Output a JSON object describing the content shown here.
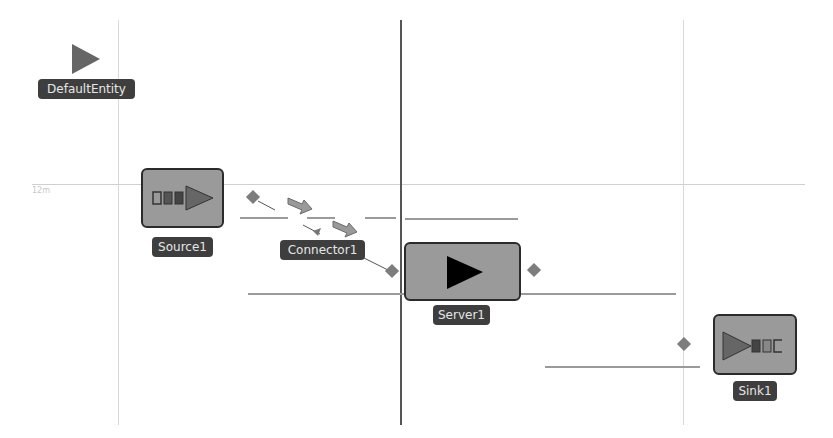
{
  "canvas": {
    "grid_label": "12m",
    "background": "#ffffff"
  },
  "entities": {
    "default_entity": {
      "label": "DefaultEntity"
    },
    "source": {
      "label": "Source1"
    },
    "connector": {
      "label": "Connector1"
    },
    "server": {
      "label": "Server1"
    },
    "sink": {
      "label": "Sink1"
    }
  },
  "colors": {
    "node_fill": "#9a9a9a",
    "node_border": "#2b2b2b",
    "label_bg": "#3e3e3e",
    "label_text": "#e6e6e6",
    "port": "#7d7d7d",
    "arrow": "#909090"
  }
}
